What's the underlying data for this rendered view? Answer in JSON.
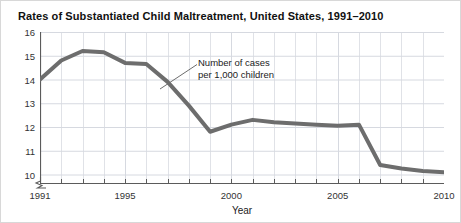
{
  "figure": {
    "title": "Rates of Substantiated Child Maltreatment, United States, 1991–2010",
    "border_color": "#d8d8d8",
    "background_color": "#ffffff"
  },
  "axes": {
    "x_title": "Year",
    "x_tick_labels": [
      "1991",
      "1995",
      "2000",
      "2005",
      "2010"
    ],
    "y_tick_labels": [
      "10",
      "11",
      "12",
      "13",
      "14",
      "15",
      "16"
    ],
    "grid_color": "#d6d9e0",
    "axis_color": "#5b5b5b",
    "axis_break_icon": "axis-break-zigzag"
  },
  "annotation": {
    "line1": "Number of cases",
    "line2": "per 1,000 children",
    "leader_color": "#6d6d6d"
  },
  "chart_data": {
    "type": "line",
    "title": "Rates of Substantiated Child Maltreatment, United States, 1991–2010",
    "xlabel": "Year",
    "ylabel": "",
    "series_label": "Number of cases per 1,000 children",
    "line_color": "#6d6d6d",
    "line_width": 4,
    "grid": true,
    "legend": "none",
    "xlim": [
      1991,
      2010
    ],
    "ylim": [
      9.6,
      16
    ],
    "y_axis_break": true,
    "x_tick_values": [
      1991,
      1995,
      2000,
      2005,
      2010
    ],
    "x_minor_ticks_every": 1,
    "y_tick_values": [
      10,
      11,
      12,
      13,
      14,
      15,
      16
    ],
    "x": [
      1991,
      1992,
      1993,
      1994,
      1995,
      1996,
      1997,
      1998,
      1999,
      2000,
      2001,
      2002,
      2003,
      2004,
      2005,
      2006,
      2007,
      2008,
      2009,
      2010
    ],
    "values": [
      14.0,
      14.8,
      15.2,
      15.15,
      14.7,
      14.65,
      13.9,
      12.9,
      11.8,
      12.1,
      12.3,
      12.2,
      12.15,
      12.1,
      12.05,
      12.1,
      10.4,
      10.25,
      10.15,
      10.1
    ]
  }
}
